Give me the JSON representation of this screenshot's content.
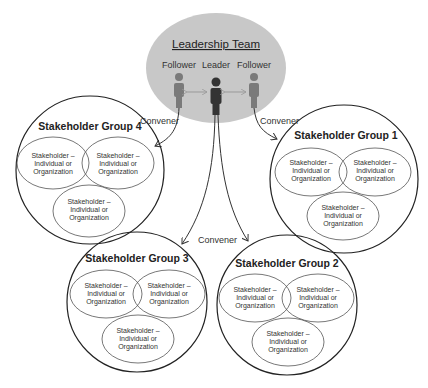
{
  "leadership": {
    "title": "Leadership Team",
    "roles": [
      "Follower",
      "Leader",
      "Follower"
    ],
    "fill": "#c8c8c8"
  },
  "convener_label": "Convener",
  "groups": [
    {
      "title": "Stakeholder Group 4",
      "members": [
        [
          "Stakeholder –",
          "Individual or",
          "Organization"
        ],
        [
          "Stakeholder –",
          "Individual or",
          "Organization"
        ],
        [
          "Stakeholder –",
          "Individual or",
          "Organization"
        ]
      ]
    },
    {
      "title": "Stakeholder Group 1",
      "members": [
        [
          "Stakeholder –",
          "Individual or",
          "Organization"
        ],
        [
          "Stakeholder –",
          "Individual or",
          "Organization"
        ],
        [
          "Stakeholder –",
          "Individual or",
          "Organization"
        ]
      ]
    },
    {
      "title": "Stakeholder Group 3",
      "members": [
        [
          "Stakeholder –",
          "Individual or",
          "Organization"
        ],
        [
          "Stakeholder –",
          "Individual or",
          "Organization"
        ],
        [
          "Stakeholder –",
          "Individual or",
          "Organization"
        ]
      ]
    },
    {
      "title": "Stakeholder Group 2",
      "members": [
        [
          "Stakeholder –",
          "Individual or",
          "Organization"
        ],
        [
          "Stakeholder –",
          "Individual or",
          "Organization"
        ],
        [
          "Stakeholder –",
          "Individual or",
          "Organization"
        ]
      ]
    }
  ],
  "colors": {
    "follower": "#7a7a7a",
    "leader": "#333333",
    "arrow": "#999999",
    "stroke": "#222222"
  }
}
